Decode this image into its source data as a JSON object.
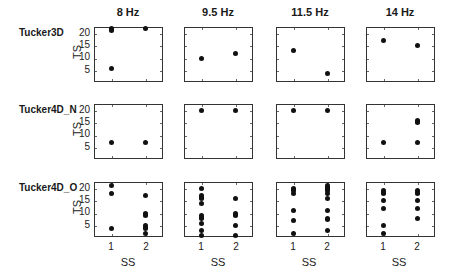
{
  "chart_data": {
    "type": "scatter",
    "layout": "3x4 small multiples",
    "columns": [
      "8 Hz",
      "9.5 Hz",
      "11.5 Hz",
      "14 Hz"
    ],
    "rows": [
      "Tucker3D",
      "Tucker4D_N",
      "Tucker4D_O"
    ],
    "xlabel": "SS",
    "ylabel": "TS",
    "xticks": [
      1,
      2
    ],
    "yticks": [
      5,
      10,
      15,
      20
    ],
    "xlim": [
      0.5,
      2.5
    ],
    "ylim": [
      0.5,
      22.5
    ],
    "grid": false,
    "panels": [
      {
        "row": "Tucker3D",
        "col": "8 Hz",
        "points": [
          [
            1,
            22
          ],
          [
            1,
            21.5
          ],
          [
            1,
            21
          ],
          [
            1,
            6
          ],
          [
            2,
            22
          ]
        ]
      },
      {
        "row": "Tucker3D",
        "col": "9.5 Hz",
        "points": [
          [
            1,
            10
          ],
          [
            2,
            12
          ]
        ]
      },
      {
        "row": "Tucker3D",
        "col": "11.5 Hz",
        "points": [
          [
            1,
            13
          ],
          [
            2,
            4
          ]
        ]
      },
      {
        "row": "Tucker3D",
        "col": "14 Hz",
        "points": [
          [
            1,
            17
          ],
          [
            2,
            15
          ]
        ]
      },
      {
        "row": "Tucker4D_N",
        "col": "8 Hz",
        "points": [
          [
            1,
            7
          ],
          [
            2,
            7
          ]
        ]
      },
      {
        "row": "Tucker4D_N",
        "col": "9.5 Hz",
        "points": [
          [
            1,
            20
          ],
          [
            2,
            20
          ]
        ]
      },
      {
        "row": "Tucker4D_N",
        "col": "11.5 Hz",
        "points": [
          [
            1,
            20
          ],
          [
            2,
            20
          ]
        ]
      },
      {
        "row": "Tucker4D_N",
        "col": "14 Hz",
        "points": [
          [
            1,
            7
          ],
          [
            2,
            16
          ],
          [
            2,
            15.5
          ],
          [
            2,
            15
          ],
          [
            2,
            7
          ]
        ]
      },
      {
        "row": "Tucker4D_O",
        "col": "8 Hz",
        "points": [
          [
            1,
            21
          ],
          [
            1,
            18
          ],
          [
            1,
            4
          ],
          [
            2,
            17
          ],
          [
            2,
            10
          ],
          [
            2,
            9.5
          ],
          [
            2,
            9
          ],
          [
            2,
            5
          ],
          [
            2,
            4.5
          ],
          [
            2,
            4
          ],
          [
            2,
            2
          ]
        ]
      },
      {
        "row": "Tucker4D_O",
        "col": "9.5 Hz",
        "points": [
          [
            1,
            20
          ],
          [
            1,
            17
          ],
          [
            1,
            16.5
          ],
          [
            1,
            16
          ],
          [
            1,
            14
          ],
          [
            1,
            9
          ],
          [
            1,
            8.5
          ],
          [
            1,
            8
          ],
          [
            1,
            6
          ],
          [
            1,
            3
          ],
          [
            1,
            1
          ],
          [
            2,
            16
          ],
          [
            2,
            10
          ],
          [
            2,
            9.5
          ],
          [
            2,
            9
          ],
          [
            2,
            5
          ],
          [
            2,
            1
          ]
        ]
      },
      {
        "row": "Tucker4D_O",
        "col": "11.5 Hz",
        "points": [
          [
            1,
            20
          ],
          [
            1,
            19.5
          ],
          [
            1,
            19
          ],
          [
            1,
            18
          ],
          [
            1,
            11
          ],
          [
            1,
            7
          ],
          [
            1,
            2
          ],
          [
            2,
            21
          ],
          [
            2,
            20.5
          ],
          [
            2,
            20
          ],
          [
            2,
            19.5
          ],
          [
            2,
            19
          ],
          [
            2,
            18
          ],
          [
            2,
            16
          ],
          [
            2,
            11
          ],
          [
            2,
            8
          ],
          [
            2,
            7.5
          ],
          [
            2,
            3
          ]
        ]
      },
      {
        "row": "Tucker4D_O",
        "col": "14 Hz",
        "points": [
          [
            1,
            19
          ],
          [
            1,
            18.5
          ],
          [
            1,
            18
          ],
          [
            1,
            15
          ],
          [
            1,
            12
          ],
          [
            1,
            5
          ],
          [
            1,
            2
          ],
          [
            2,
            19
          ],
          [
            2,
            18.5
          ],
          [
            2,
            18
          ],
          [
            2,
            15
          ],
          [
            2,
            12
          ],
          [
            2,
            8
          ]
        ]
      }
    ]
  },
  "labels": {
    "col_titles": [
      "8 Hz",
      "9.5 Hz",
      "11.5 Hz",
      "14 Hz"
    ],
    "row_titles": [
      "Tucker3D",
      "Tucker4D_N",
      "Tucker4D_O"
    ],
    "xlabel": "SS",
    "ylabel": "TS",
    "xtick_labels": [
      "1",
      "2"
    ],
    "ytick_labels": [
      "20",
      "15",
      "10",
      "5"
    ]
  }
}
